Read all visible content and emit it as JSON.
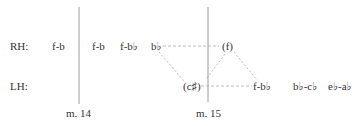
{
  "rows": {
    "rh_label": "RH:",
    "lh_label": "LH:"
  },
  "rh_notes": [
    {
      "text": "f-b",
      "x": 52
    },
    {
      "text": "f-b",
      "x": 92
    },
    {
      "text": "f-b♭",
      "x": 120
    },
    {
      "text": "b♭",
      "x": 151
    },
    {
      "text": "(f)",
      "x": 222
    }
  ],
  "lh_notes": [
    {
      "text": "(c♯)",
      "x": 183
    },
    {
      "text": "f-b♭",
      "x": 253
    },
    {
      "text": "b♭-c♭",
      "x": 293
    },
    {
      "text": "e♭-a♭",
      "x": 328
    }
  ],
  "measures": [
    {
      "label": "m. 14",
      "x": 79
    },
    {
      "label": "m. 15",
      "x": 208
    }
  ],
  "colors": {
    "text": "#333333",
    "barline": "#9a9a9a",
    "dashed": "#a8a8a8"
  }
}
